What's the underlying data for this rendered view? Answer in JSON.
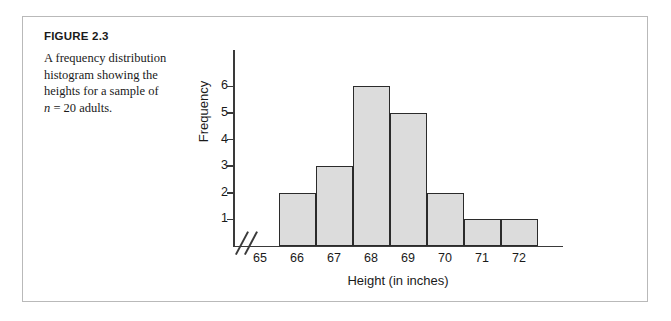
{
  "figure": {
    "label": "FIGURE 2.3",
    "caption_line1": "A frequency distribution",
    "caption_line2": "histogram showing the",
    "caption_line3": "heights for a sample of",
    "caption_n_symbol": "n",
    "caption_line4_rest": " = 20 adults."
  },
  "colors": {
    "bar_fill": "#dcdcdc",
    "bar_stroke": "#2b2b2b",
    "axis": "#3a3a3a",
    "frame": "#b9b9b9",
    "text": "#1a1a1a"
  },
  "chart_data": {
    "type": "bar",
    "title": "",
    "subtitle": "",
    "xlabel": "Height (in inches)",
    "ylabel": "Frequency",
    "categories": [
      "65",
      "66",
      "67",
      "68",
      "69",
      "70",
      "71",
      "72"
    ],
    "values": [
      0,
      2,
      3,
      6,
      5,
      2,
      1,
      1
    ],
    "xlim": [
      64.5,
      72.5
    ],
    "ylim": [
      0,
      6
    ],
    "yticks": [
      "1",
      "2",
      "3",
      "4",
      "5",
      "6"
    ],
    "ytick_values": [
      1,
      2,
      3,
      4,
      5,
      6
    ],
    "grid": false,
    "legend": false,
    "axis_break": true,
    "axis_break_note": "//",
    "sample_size": 20,
    "bars": [
      {
        "category": "66",
        "value": 2
      },
      {
        "category": "67",
        "value": 3
      },
      {
        "category": "68",
        "value": 6
      },
      {
        "category": "69",
        "value": 5
      },
      {
        "category": "70",
        "value": 2
      },
      {
        "category": "71",
        "value": 1
      },
      {
        "category": "72",
        "value": 1
      }
    ]
  }
}
